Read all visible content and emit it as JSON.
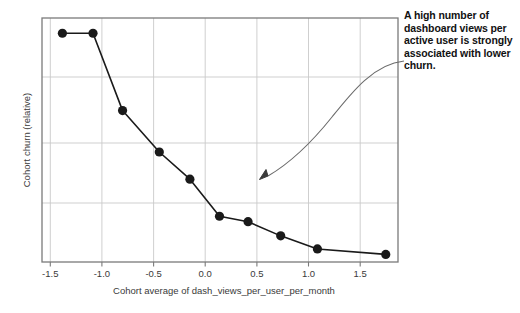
{
  "chart_data": {
    "type": "line",
    "title": "",
    "subtitle": "",
    "xlabel": "Cohort average of dash_views_per_user_per_month",
    "ylabel": "Cohort churn (relative)",
    "xlim": [
      -1.62,
      1.87
    ],
    "ylim": [
      -0.22,
      2.02
    ],
    "xticks": [
      -1.5,
      -1.0,
      -0.5,
      0.0,
      0.5,
      1.0,
      1.5
    ],
    "xticklabels": [
      "-1.5",
      "-1.0",
      "-0.5",
      "0.0",
      "0.5",
      "1.0",
      "1.5"
    ],
    "yticks": [],
    "yticklabels": [],
    "grid": true,
    "legend": false,
    "marker": "circle",
    "series": [
      {
        "name": "Cohort churn (relative)",
        "color": "#1a1a1a",
        "x": [
          -1.42,
          -1.12,
          -0.83,
          -0.47,
          -0.17,
          0.12,
          0.4,
          0.72,
          1.08,
          1.75
        ],
        "y": [
          1.88,
          1.88,
          1.17,
          0.79,
          0.54,
          0.2,
          0.15,
          0.02,
          -0.1,
          -0.15
        ]
      }
    ],
    "annotations": [
      {
        "text": "A high number of dashboard views per active user is strongly associated with lower churn.",
        "arrow": true,
        "arrow_target_x": 0.55,
        "arrow_target_y": 0.47
      }
    ]
  },
  "axis": {
    "xlabel": "Cohort average of dash_views_per_user_per_month",
    "ylabel": "Cohort churn (relative)",
    "xtick_0": "-1.5",
    "xtick_1": "-1.0",
    "xtick_2": "-0.5",
    "xtick_3": "0.0",
    "xtick_4": "0.5",
    "xtick_5": "1.0",
    "xtick_6": "1.5"
  },
  "annotation": {
    "text": "A high number of dashboard views per active user is strongly associated with lower churn."
  },
  "colors": {
    "line": "#1a1a1a",
    "marker": "#111111",
    "grid": "#c9c9c9",
    "frame": "#7a7a7a",
    "text": "#3a3a3a",
    "annotation_text": "#111111",
    "arrow": "#6b6b6b",
    "background": "#ffffff"
  }
}
